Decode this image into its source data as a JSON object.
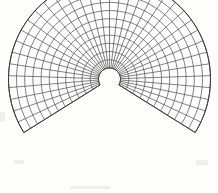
{
  "figure": {
    "background_color": "#fdfdfc",
    "line_color": "#4a4a4a",
    "boundary_color": "#3a3a3a",
    "fill_color": "#ffffff"
  },
  "chart_data": {
    "type": "mesh",
    "geometry": "annular-sector",
    "title": "",
    "xlabel": "",
    "ylabel": "",
    "center": {
      "x": 109.5,
      "y": 79.0
    },
    "inner_radius": 11,
    "outer_radius": 101,
    "start_angle_deg": 148,
    "end_angle_deg": 392,
    "sweep_deg": 244,
    "angular_divisions": 36,
    "radial_divisions": 11,
    "radial_ring_radii": [
      11,
      19.2,
      27.4,
      35.6,
      43.8,
      52.0,
      60.2,
      68.4,
      76.6,
      84.8,
      93.0,
      101
    ],
    "spoke_angles_deg": [
      148,
      154.78,
      161.56,
      168.33,
      175.11,
      181.89,
      188.67,
      195.44,
      202.22,
      209,
      215.78,
      222.56,
      229.33,
      236.11,
      242.89,
      249.67,
      256.44,
      263.22,
      270,
      276.78,
      283.56,
      290.33,
      297.11,
      303.89,
      310.67,
      317.44,
      324.22,
      331,
      337.78,
      344.56,
      351.33,
      358.11,
      364.89,
      371.67,
      378.44,
      385.22,
      392
    ],
    "grid": true,
    "legend": null,
    "annotations": []
  },
  "specks": [
    {
      "x": 196,
      "y": 160,
      "w": 12,
      "h": 5
    },
    {
      "x": 14,
      "y": 160,
      "w": 10,
      "h": 4
    },
    {
      "x": 70,
      "y": 186,
      "w": 40,
      "h": 3
    },
    {
      "x": 0,
      "y": 112,
      "w": 5,
      "h": 10
    }
  ]
}
